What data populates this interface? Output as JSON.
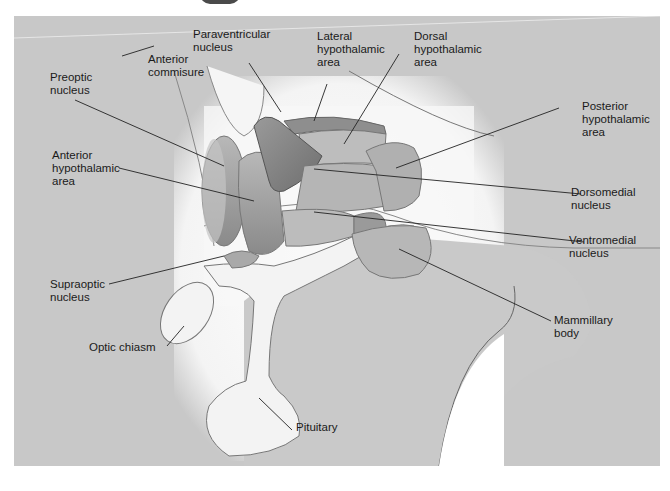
{
  "figure": {
    "colors": {
      "background": "#c8c8c8",
      "glow": "#f7f7f7",
      "nucleus_dark": "#8e8e8e",
      "nucleus_mid": "#a9a9a9",
      "structure_light": "#f2f2f2",
      "leader_line": "#222222"
    }
  },
  "labels": {
    "paraventricular": "Paraventricular\nnucleus",
    "lateral": "Lateral\nhypothalamic\narea",
    "dorsal": "Dorsal\nhypothalamic\narea",
    "preoptic": "Preoptic\nnucleus",
    "anterior_commissure": "Anterior\ncommisure",
    "anterior_hypothalamic": "Anterior\nhypothalamic\narea",
    "posterior": "Posterior\nhypothalamic\narea",
    "dorsomedial": "Dorsomedial\nnucleus",
    "ventromedial": "Ventromedial\nnucleus",
    "supraoptic": "Supraoptic\nnucleus",
    "mammillary": "Mammillary\nbody",
    "optic_chiasm": "Optic chiasm",
    "pituitary": "Pituitary"
  }
}
